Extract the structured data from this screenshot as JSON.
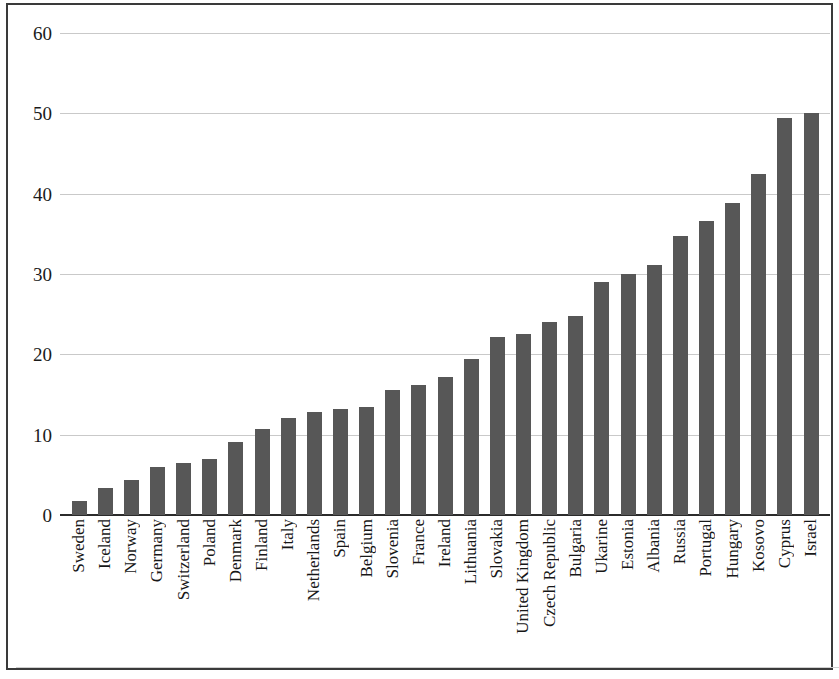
{
  "chart_data": {
    "type": "bar",
    "title": "",
    "subtitle": "",
    "xlabel": "",
    "ylabel": "",
    "ylim": [
      0,
      60
    ],
    "yticks": [
      0,
      10,
      20,
      30,
      40,
      50,
      60
    ],
    "ytick_labels": [
      "0",
      "10",
      "20",
      "30",
      "40",
      "50",
      "60"
    ],
    "grid": true,
    "legend": null,
    "bar_color": "#575757",
    "categories": [
      "Sweden",
      "Iceland",
      "Norway",
      "Germany",
      "Switzerland",
      "Poland",
      "Denmark",
      "Finland",
      "Italy",
      "Netherlands",
      "Spain",
      "Belgium",
      "Slovenia",
      "France",
      "Ireland",
      "Lithuania",
      "Slovakia",
      "United Kingdom",
      "Czech Republic",
      "Bulgaria",
      "Ukarine",
      "Estonia",
      "Albania",
      "Russia",
      "Portugal",
      "Hungary",
      "Kosovo",
      "Cyprus",
      "Israel"
    ],
    "values": [
      1.7,
      3.4,
      4.3,
      6.0,
      6.5,
      7.0,
      9.1,
      10.7,
      12.1,
      12.8,
      13.2,
      13.5,
      15.6,
      16.2,
      17.2,
      19.4,
      22.2,
      22.5,
      24.0,
      24.8,
      29.0,
      30.0,
      31.1,
      34.7,
      36.6,
      38.8,
      42.4,
      49.4,
      50.0
    ]
  }
}
